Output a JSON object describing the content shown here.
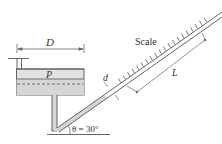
{
  "diagram": {
    "labels": {
      "diameter": "D",
      "pressure": "P",
      "tube_diameter": "d",
      "scale": "Scale",
      "length": "L",
      "angle": "θ = 30°"
    },
    "colors": {
      "line": "#555555",
      "fluid_fill": "#d9d9d9",
      "fluid_fill_light": "#e6e6e6",
      "background": "#ffffff"
    },
    "angle_deg": 30
  }
}
